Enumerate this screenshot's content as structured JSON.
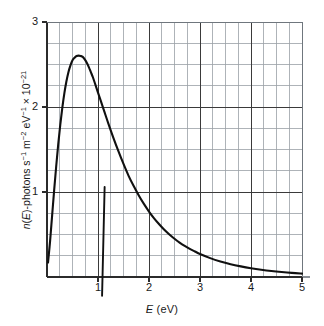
{
  "figure": {
    "background_color": "#ffffff",
    "curve_color": "#101010",
    "grid_color": "#9aa0a6",
    "axis_color": "#2b2b2b"
  },
  "axis_titles": {
    "x_prefix": "E",
    "x_suffix": " (eV)",
    "y_full": "n(E)-photons s-1 m-2 eV-1 x 10-21"
  },
  "chart_data": {
    "type": "line",
    "title": "",
    "subtitle": "",
    "xlabel": "E (eV)",
    "ylabel": "n(E)-photons s^-1 m^-2 eV^-1 x 10^-21",
    "xlim": [
      0,
      5
    ],
    "ylim": [
      0,
      3
    ],
    "grid": true,
    "grid_minor_step_x": 0.25,
    "grid_minor_step_y": 0.25,
    "legend": "none",
    "x_ticks": [
      1,
      2,
      3,
      4,
      5
    ],
    "x_tick_labels": [
      "1",
      "2",
      "3",
      "4",
      "5"
    ],
    "y_ticks": [
      1,
      2,
      3
    ],
    "y_tick_labels": [
      "1",
      "2",
      "3"
    ],
    "peak": {
      "x": 0.72,
      "y": 2.6
    },
    "series": [
      {
        "name": "photon spectral flux",
        "x": [
          0.02,
          0.06,
          0.1,
          0.14,
          0.18,
          0.22,
          0.26,
          0.3,
          0.34,
          0.38,
          0.42,
          0.46,
          0.5,
          0.54,
          0.58,
          0.62,
          0.66,
          0.7,
          0.74,
          0.78,
          0.82,
          0.86,
          0.9,
          0.95,
          1.0,
          1.05,
          1.1,
          1.15,
          1.2,
          1.3,
          1.4,
          1.5,
          1.6,
          1.7,
          1.8,
          1.9,
          2.0,
          2.1,
          2.2,
          2.3,
          2.4,
          2.5,
          2.6,
          2.7,
          2.8,
          2.9,
          3.0,
          3.2,
          3.4,
          3.6,
          3.8,
          4.0,
          4.2,
          4.4,
          4.6,
          4.8,
          5.0
        ],
        "y": [
          0.17,
          0.42,
          0.72,
          1.02,
          1.3,
          1.56,
          1.79,
          1.99,
          2.16,
          2.3,
          2.41,
          2.49,
          2.55,
          2.58,
          2.6,
          2.605,
          2.6,
          2.59,
          2.56,
          2.52,
          2.47,
          2.41,
          2.35,
          2.26,
          2.17,
          2.08,
          1.99,
          1.9,
          1.81,
          1.64,
          1.48,
          1.33,
          1.19,
          1.07,
          0.96,
          0.86,
          0.77,
          0.69,
          0.62,
          0.555,
          0.5,
          0.45,
          0.405,
          0.365,
          0.33,
          0.3,
          0.27,
          0.222,
          0.183,
          0.151,
          0.125,
          0.103,
          0.085,
          0.07,
          0.058,
          0.048,
          0.04
        ]
      }
    ],
    "artifacts": [
      {
        "name": "scan-streak",
        "description": "slanted vertical dark streak near x = 1.1",
        "x_top": 1.13,
        "y_top": 1.06,
        "x_bottom": 1.08,
        "y_bottom": -0.22
      }
    ]
  }
}
